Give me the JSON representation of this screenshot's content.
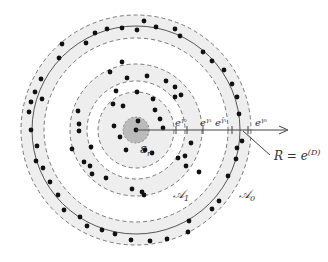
{
  "diagram": {
    "center": [
      136,
      130
    ],
    "rings": {
      "outer_band": {
        "inner_r": 92,
        "outer_r": 115,
        "solid_r": 104,
        "fill": "#eeeeee"
      },
      "middle_band": {
        "inner_r": 49,
        "outer_r": 66,
        "fill": "#eeeeee"
      },
      "inner_disk": {
        "r": 38,
        "fill": "#eeeeee"
      },
      "core": {
        "r": 13,
        "fill": "#bbbbbb"
      }
    },
    "labels": {
      "core": "ε",
      "core_sub": "r",
      "tick1": "e",
      "tick1_sup": "γ₂",
      "tick2": "e",
      "tick2_sup": "γ₁",
      "tick3": "e",
      "tick3_sup": "γ̃₁",
      "tick4": "e",
      "tick4_sup": "γ₀",
      "radius_label": "R = e",
      "radius_sup": "(D)",
      "annulus1": "𝒜",
      "annulus1_sub": "1",
      "annulus0": "𝒜",
      "annulus0_sub": "0"
    },
    "dots": [
      [
        144,
        21
      ],
      [
        107,
        29
      ],
      [
        122,
        28
      ],
      [
        137,
        30
      ],
      [
        156,
        27
      ],
      [
        175,
        29
      ],
      [
        180,
        36
      ],
      [
        203,
        52
      ],
      [
        212,
        61
      ],
      [
        224,
        70
      ],
      [
        232,
        84
      ],
      [
        237,
        97
      ],
      [
        239,
        114
      ],
      [
        242,
        141
      ],
      [
        237,
        148
      ],
      [
        236,
        159
      ],
      [
        228,
        176
      ],
      [
        219,
        201
      ],
      [
        212,
        209
      ],
      [
        189,
        221
      ],
      [
        188,
        232
      ],
      [
        167,
        239
      ],
      [
        150,
        241
      ],
      [
        131,
        240
      ],
      [
        115,
        234
      ],
      [
        102,
        230
      ],
      [
        87,
        226
      ],
      [
        80,
        217
      ],
      [
        64,
        210
      ],
      [
        58,
        195
      ],
      [
        50,
        182
      ],
      [
        43,
        168
      ],
      [
        36,
        161
      ],
      [
        37,
        146
      ],
      [
        31,
        130
      ],
      [
        29,
        112
      ],
      [
        31,
        102
      ],
      [
        41,
        79
      ],
      [
        35,
        92
      ],
      [
        59,
        58
      ],
      [
        62,
        44
      ],
      [
        86,
        43
      ],
      [
        95,
        33
      ],
      [
        42,
        99
      ],
      [
        122,
        62
      ],
      [
        110,
        72
      ],
      [
        127,
        78
      ],
      [
        147,
        76
      ],
      [
        166,
        81
      ],
      [
        175,
        87
      ],
      [
        155,
        110
      ],
      [
        153,
        99
      ],
      [
        116,
        91
      ],
      [
        181,
        95
      ],
      [
        78,
        111
      ],
      [
        79,
        124
      ],
      [
        72,
        149
      ],
      [
        91,
        147
      ],
      [
        90,
        166
      ],
      [
        92,
        174
      ],
      [
        106,
        178
      ],
      [
        132,
        189
      ],
      [
        142,
        192
      ],
      [
        144,
        195
      ],
      [
        199,
        172
      ],
      [
        186,
        166
      ],
      [
        185,
        156
      ],
      [
        191,
        143
      ],
      [
        79,
        131
      ],
      [
        84,
        162
      ],
      [
        136,
        130
      ],
      [
        138,
        121
      ],
      [
        113,
        104
      ],
      [
        123,
        106
      ],
      [
        137,
        92
      ],
      [
        175,
        97
      ],
      [
        114,
        126
      ],
      [
        120,
        137
      ],
      [
        126,
        150
      ],
      [
        145,
        150
      ],
      [
        152,
        153
      ],
      [
        178,
        158
      ],
      [
        160,
        119
      ],
      [
        163,
        128
      ]
    ],
    "dot_color": "#111111"
  }
}
